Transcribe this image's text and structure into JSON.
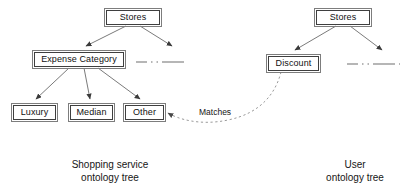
{
  "diagram": {
    "title_left": "Shopping service\nontology tree",
    "title_right": "User\nontology tree",
    "match_label": "Matches",
    "colors": {
      "background": "#ffffff",
      "node_border": "#3f3f3f",
      "node_outer_border": "#7d7d7d",
      "edge": "#6b6b6b",
      "dotted_edge": "#9a9a9a",
      "text": "#111111"
    },
    "left_tree": {
      "root": {
        "label": "Stores"
      },
      "children": [
        {
          "label": "Expense Category"
        },
        {
          "label": "",
          "kind": "dash-dot-placeholder"
        }
      ],
      "leaves": [
        {
          "label": "Luxury"
        },
        {
          "label": "Median"
        },
        {
          "label": "Other"
        }
      ]
    },
    "right_tree": {
      "root": {
        "label": "Stores"
      },
      "children": [
        {
          "label": "Discount"
        },
        {
          "label": "",
          "kind": "dash-dot-placeholder"
        }
      ]
    }
  }
}
